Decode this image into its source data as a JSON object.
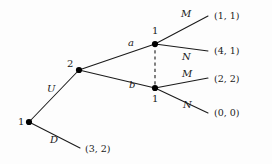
{
  "figure": {
    "type": "extensive-form-game-tree",
    "background_color": "#fdfdfd",
    "line_color": "#1a1a1a",
    "node_color": "#000000"
  },
  "nodes": [
    {
      "id": "root",
      "player_label": "1",
      "x": 29,
      "y": 122,
      "label_x": 18,
      "label_y": 117,
      "kind": "decision"
    },
    {
      "id": "n2",
      "player_label": "2",
      "x": 79,
      "y": 70,
      "label_x": 67,
      "label_y": 59,
      "kind": "decision"
    },
    {
      "id": "a",
      "player_label": "1",
      "x": 155,
      "y": 44,
      "label_x": 152,
      "label_y": 26,
      "kind": "decision"
    },
    {
      "id": "b",
      "player_label": "1",
      "x": 155,
      "y": 88,
      "label_x": 152,
      "label_y": 94,
      "kind": "decision"
    }
  ],
  "info_set": {
    "name": "information-set-link",
    "from_x": 155,
    "from_y": 44,
    "to_x": 155,
    "to_y": 88,
    "style": "dashed"
  },
  "node_names": [
    {
      "text": "a",
      "x": 128,
      "y": 38
    },
    {
      "text": "b",
      "x": 129,
      "y": 80
    }
  ],
  "edges": [
    {
      "id": "edge-U",
      "from": "root",
      "to": "n2",
      "x1": 29,
      "y1": 122,
      "x2": 79,
      "y2": 70
    },
    {
      "id": "edge-D",
      "from": "root",
      "to": "out-D",
      "x1": 29,
      "y1": 122,
      "x2": 80,
      "y2": 148
    },
    {
      "id": "edge-a",
      "from": "n2",
      "to": "a",
      "x1": 79,
      "y1": 70,
      "x2": 155,
      "y2": 44
    },
    {
      "id": "edge-b",
      "from": "n2",
      "to": "b",
      "x1": 79,
      "y1": 70,
      "x2": 155,
      "y2": 88
    },
    {
      "id": "edge-a-M",
      "from": "a",
      "to": "out-11",
      "x1": 155,
      "y1": 44,
      "x2": 208,
      "y2": 16
    },
    {
      "id": "edge-a-N",
      "from": "a",
      "to": "out-41",
      "x1": 155,
      "y1": 44,
      "x2": 208,
      "y2": 51
    },
    {
      "id": "edge-b-M",
      "from": "b",
      "to": "out-22",
      "x1": 155,
      "y1": 88,
      "x2": 208,
      "y2": 78
    },
    {
      "id": "edge-b-N",
      "from": "b",
      "to": "out-00",
      "x1": 155,
      "y1": 88,
      "x2": 208,
      "y2": 113
    }
  ],
  "action_labels": [
    {
      "id": "action-U",
      "text": "U",
      "x": 47,
      "y": 84
    },
    {
      "id": "action-D",
      "text": "D",
      "x": 50,
      "y": 135
    },
    {
      "id": "action-M-top",
      "text": "M",
      "x": 181,
      "y": 9
    },
    {
      "id": "action-N-top",
      "text": "N",
      "x": 182,
      "y": 52
    },
    {
      "id": "action-M-bottom",
      "text": "M",
      "x": 182,
      "y": 69
    },
    {
      "id": "action-N-bottom",
      "text": "N",
      "x": 183,
      "y": 100
    }
  ],
  "payoffs": [
    {
      "id": "payoff-1-1",
      "text": "(1, 1)",
      "x": 214,
      "y": 11,
      "values": [
        1,
        1
      ]
    },
    {
      "id": "payoff-4-1",
      "text": "(4, 1)",
      "x": 214,
      "y": 46,
      "values": [
        4,
        1
      ]
    },
    {
      "id": "payoff-2-2",
      "text": "(2, 2)",
      "x": 214,
      "y": 74,
      "values": [
        2,
        2
      ]
    },
    {
      "id": "payoff-0-0",
      "text": "(0, 0)",
      "x": 214,
      "y": 108,
      "values": [
        0,
        0
      ]
    },
    {
      "id": "payoff-3-2",
      "text": "(3, 2)",
      "x": 85,
      "y": 144,
      "values": [
        3,
        2
      ]
    }
  ]
}
